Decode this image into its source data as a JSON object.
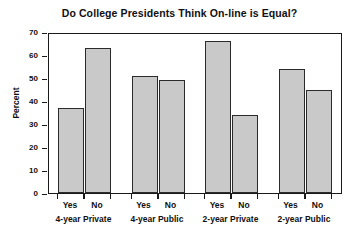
{
  "chart_data": {
    "type": "bar",
    "title": "Do College Presidents Think On-line is Equal?",
    "xlabel": "",
    "ylabel": "Percent",
    "ylim": [
      0,
      70
    ],
    "yticks": [
      0,
      10,
      20,
      30,
      40,
      50,
      60,
      70
    ],
    "grid": false,
    "legend": false,
    "categories": [
      "4-year Private",
      "4-year Public",
      "2-year Private",
      "2-year Public"
    ],
    "subcategories": [
      "Yes",
      "No"
    ],
    "series": [
      {
        "name": "Yes",
        "values": [
          37,
          51,
          66,
          54
        ]
      },
      {
        "name": "No",
        "values": [
          63,
          49,
          34,
          45
        ]
      }
    ],
    "bars": [
      {
        "group": "4-year Private",
        "answer": "Yes",
        "value": 37
      },
      {
        "group": "4-year Private",
        "answer": "No",
        "value": 63
      },
      {
        "group": "4-year Public",
        "answer": "Yes",
        "value": 51
      },
      {
        "group": "4-year Public",
        "answer": "No",
        "value": 49
      },
      {
        "group": "2-year Private",
        "answer": "Yes",
        "value": 66
      },
      {
        "group": "2-year Private",
        "answer": "No",
        "value": 34
      },
      {
        "group": "2-year Public",
        "answer": "Yes",
        "value": 54
      },
      {
        "group": "2-year Public",
        "answer": "No",
        "value": 45
      }
    ],
    "colors": {
      "bar_fill": "#c9c9c9",
      "bar_edge": "#2b2b2b",
      "axis": "#1a1a1a",
      "text": "#101010",
      "background": "#ffffff"
    }
  },
  "ytick_labels": [
    "0",
    "10",
    "20",
    "30",
    "40",
    "50",
    "60",
    "70"
  ],
  "bar_labels": [
    "Yes",
    "No",
    "Yes",
    "No",
    "Yes",
    "No",
    "Yes",
    "No"
  ],
  "group_labels": [
    "4-year Private",
    "4-year Public",
    "2-year Private",
    "2-year Public"
  ]
}
